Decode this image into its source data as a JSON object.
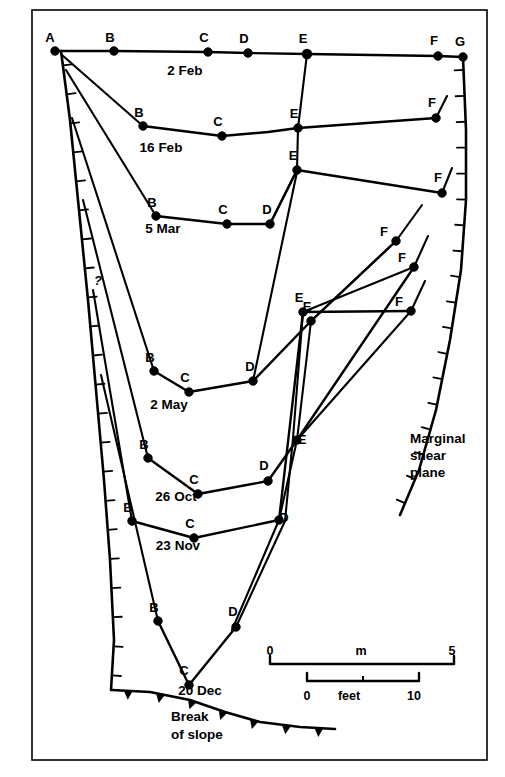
{
  "figure": {
    "type": "glacier-crevasse-cross-section",
    "frame": {
      "x": 32,
      "y": 10,
      "width": 455,
      "height": 750,
      "stroke": "#000000",
      "stroke_width": 1.6
    },
    "colors": {
      "line": "#000000",
      "background": "#ffffff",
      "point": "#000000"
    }
  },
  "station_letters": {
    "A": "A",
    "B": "B",
    "C": "C",
    "D": "D",
    "E": "E",
    "F": "F",
    "G": "G"
  },
  "profiles": [
    {
      "id": "profile-2-feb",
      "date_label": "2 Feb",
      "date_label_pos": {
        "x": 185,
        "y": 75
      },
      "points": [
        {
          "letter": "A",
          "x": 55,
          "y": 51,
          "label_dx": -5,
          "label_dy": -9
        },
        {
          "letter": "B",
          "x": 114,
          "y": 51,
          "label_dx": -4,
          "label_dy": -9
        },
        {
          "letter": "C",
          "x": 208,
          "y": 52,
          "label_dx": -4,
          "label_dy": -10
        },
        {
          "letter": "D",
          "x": 248,
          "y": 53,
          "label_dx": -4,
          "label_dy": -10
        },
        {
          "letter": "E",
          "x": 307,
          "y": 54,
          "label_dx": -4,
          "label_dy": -11
        },
        {
          "letter": "F",
          "x": 438,
          "y": 56,
          "label_dx": -4,
          "label_dy": -11
        },
        {
          "letter": "G",
          "x": 463,
          "y": 57,
          "label_dx": -3,
          "label_dy": -11
        }
      ]
    },
    {
      "id": "profile-16-feb",
      "date_label": "16 Feb",
      "date_label_pos": {
        "x": 161,
        "y": 152
      },
      "points": [
        {
          "letter": "B",
          "x": 143,
          "y": 126,
          "label_dx": -4,
          "label_dy": -9
        },
        {
          "letter": "C",
          "x": 222,
          "y": 136,
          "label_dx": -4,
          "label_dy": -10
        },
        {
          "letter": "E",
          "x": 298,
          "y": 128,
          "label_dx": -4,
          "label_dy": -10
        },
        {
          "letter": "F",
          "x": 436,
          "y": 118,
          "label_dx": -4,
          "label_dy": -11
        }
      ],
      "extra_vertex": {
        "x": 268,
        "y": 132
      }
    },
    {
      "id": "profile-5-mar",
      "date_label": "5 Mar",
      "date_label_pos": {
        "x": 163,
        "y": 233
      },
      "points": [
        {
          "letter": "B",
          "x": 156,
          "y": 216,
          "label_dx": -4,
          "label_dy": -9
        },
        {
          "letter": "C",
          "x": 227,
          "y": 224,
          "label_dx": -4,
          "label_dy": -10
        },
        {
          "letter": "D",
          "x": 270,
          "y": 224,
          "label_dx": -3,
          "label_dy": -10
        },
        {
          "letter": "E",
          "x": 297,
          "y": 170,
          "label_dx": -4,
          "label_dy": -10
        },
        {
          "letter": "F",
          "x": 442,
          "y": 193,
          "label_dx": -4,
          "label_dy": -11
        }
      ]
    },
    {
      "id": "profile-2-may",
      "date_label": "2 May",
      "date_label_pos": {
        "x": 169,
        "y": 409
      },
      "points": [
        {
          "letter": "B",
          "x": 154,
          "y": 371,
          "label_dx": -4,
          "label_dy": -9
        },
        {
          "letter": "C",
          "x": 189,
          "y": 392,
          "label_dx": -4,
          "label_dy": -10
        },
        {
          "letter": "D",
          "x": 253,
          "y": 381,
          "label_dx": -3,
          "label_dy": -10
        },
        {
          "letter": "E",
          "x": 311,
          "y": 321,
          "label_dx": -4,
          "label_dy": -10
        },
        {
          "letter": "F",
          "x": 396,
          "y": 241,
          "label_dx": -12,
          "label_dy": -5
        }
      ]
    },
    {
      "id": "profile-26-oct",
      "date_label": "26 Oct",
      "date_label_pos": {
        "x": 176,
        "y": 501
      },
      "points": [
        {
          "letter": "B",
          "x": 148,
          "y": 458,
          "label_dx": -4,
          "label_dy": -9
        },
        {
          "letter": "C",
          "x": 198,
          "y": 494,
          "label_dx": -4,
          "label_dy": -10
        },
        {
          "letter": "D",
          "x": 268,
          "y": 481,
          "label_dx": -4,
          "label_dy": -11
        },
        {
          "letter": "E",
          "x": 297,
          "y": 440,
          "label_dx": 5,
          "label_dy": 4
        },
        {
          "letter": "F",
          "x": 414,
          "y": 267,
          "label_dx": -12,
          "label_dy": -5
        }
      ]
    },
    {
      "id": "profile-23-nov",
      "date_label": "23 Nov",
      "date_label_pos": {
        "x": 178,
        "y": 550
      },
      "points": [
        {
          "letter": "B",
          "x": 132,
          "y": 521,
          "label_dx": -4,
          "label_dy": -9
        },
        {
          "letter": "C",
          "x": 194,
          "y": 538,
          "label_dx": -4,
          "label_dy": -10
        },
        {
          "letter": "D",
          "x": 279,
          "y": 520,
          "label_dx": 5,
          "label_dy": 2
        },
        {
          "letter": "E",
          "x": 303,
          "y": 312,
          "label_dx": -4,
          "label_dy": -10
        },
        {
          "letter": "F",
          "x": 411,
          "y": 311,
          "label_dx": -12,
          "label_dy": -5
        }
      ]
    },
    {
      "id": "profile-20-dec",
      "date_label": "20 Dec",
      "date_label_pos": {
        "x": 200,
        "y": 695
      },
      "points": [
        {
          "letter": "B",
          "x": 158,
          "y": 621,
          "label_dx": -4,
          "label_dy": -9
        },
        {
          "letter": "C",
          "x": 189,
          "y": 685,
          "label_dx": -5,
          "label_dy": -10
        },
        {
          "letter": "D",
          "x": 236,
          "y": 627,
          "label_dx": -3,
          "label_dy": -11
        }
      ]
    }
  ],
  "annotations": {
    "marginal_shear_plane": {
      "lines": [
        "Marginal",
        "shear",
        "plane"
      ],
      "pos": {
        "x": 410,
        "y": 443
      }
    },
    "break_of_slope": {
      "lines": [
        "Break",
        "of slope"
      ],
      "pos": {
        "x": 171,
        "y": 721
      }
    },
    "question_mark": {
      "text": "?",
      "pos": {
        "x": 94,
        "y": 285
      }
    }
  },
  "scales": {
    "metric": {
      "unit_label": "m",
      "unit_label_pos": {
        "x": 361,
        "y": 655
      },
      "min_label": "0",
      "max_label": "5",
      "bar": {
        "x1": 270,
        "x2": 454,
        "y": 664,
        "tick_height": 8
      },
      "min_label_pos": {
        "x": 270,
        "y": 655
      },
      "max_label_pos": {
        "x": 452,
        "y": 655
      }
    },
    "imperial": {
      "unit_label": "feet",
      "unit_label_pos": {
        "x": 344,
        "y": 700
      },
      "min_label": "0",
      "max_label": "10",
      "bar": {
        "x1": 307,
        "x2": 419,
        "y": 681,
        "tick_height": 8
      },
      "min_label_pos": {
        "x": 307,
        "y": 700
      },
      "max_label_pos": {
        "x": 414,
        "y": 700
      }
    }
  },
  "shear_planes": {
    "left": {
      "name": "left-marginal-shear-plane",
      "path": "M 61,51 L 70,120 L 79,210 L 88,300 L 96,390 L 104,480 L 110,560 L 114,640 L 111,690",
      "tick_count": 22,
      "tick_length": 9,
      "tick_side": "right"
    },
    "right": {
      "name": "right-marginal-shear-plane",
      "path": "M 463,57 L 466,130 L 466,200 L 461,270 L 450,340 L 436,410 L 419,470 L 400,515",
      "tick_count": 18,
      "tick_length": 9,
      "tick_side": "left"
    }
  },
  "break_of_slope_line": {
    "path": "M 112,690 L 150,692 L 190,700 L 225,712 L 260,722 L 300,727 L 335,729",
    "teeth_count": 7,
    "tooth_size": 9
  }
}
